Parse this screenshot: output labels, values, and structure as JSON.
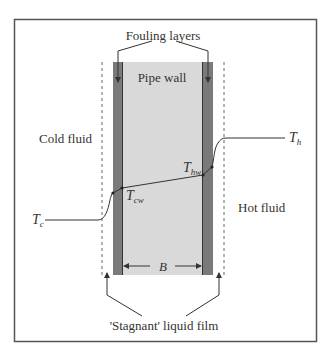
{
  "figure": {
    "labels": {
      "fouling_layers": "Fouling layers",
      "pipe_wall": "Pipe wall",
      "cold_fluid": "Cold fluid",
      "hot_fluid": "Hot fluid",
      "stagnant_film": "'Stagnant' liquid film",
      "wall_thickness": "B"
    },
    "temperatures": {
      "cold_bulk": {
        "symbol": "T",
        "subscript": "c"
      },
      "hot_bulk": {
        "symbol": "T",
        "subscript": "h"
      },
      "cold_wall": {
        "symbol": "T",
        "subscript": "cw"
      },
      "hot_wall": {
        "symbol": "T",
        "subscript": "hw"
      }
    },
    "colors": {
      "frame": "#555555",
      "fouling": "#7a7a7a",
      "pipe_wall": "#d9d9d9",
      "line": "#333333"
    }
  }
}
